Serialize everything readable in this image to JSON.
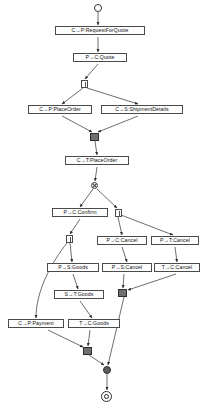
{
  "diagram": {
    "type": "uml-activity-diagram",
    "canvas": {
      "width": 206,
      "height": 412
    },
    "colors": {
      "node_fill": "#fdfdfd",
      "node_stroke": "#4a4a4a",
      "edge_stroke": "#3d3d3d",
      "join_fill": "#6f6f6f",
      "merge_fill": "#5d5d5d",
      "background": "#ffffff"
    },
    "nodes": [
      {
        "id": "start",
        "kind": "initial-state",
        "label": "",
        "x": 94,
        "y": 4,
        "w": 8,
        "h": 8
      },
      {
        "id": "rfq",
        "kind": "activity",
        "label": "C→P:RequestForQuote",
        "x": 55,
        "y": 26,
        "w": 90,
        "h": 11
      },
      {
        "id": "quote",
        "kind": "activity",
        "label": "P→C:Quote",
        "x": 73,
        "y": 53,
        "w": 54,
        "h": 11
      },
      {
        "id": "fork1",
        "kind": "fork",
        "label": "",
        "x": 81,
        "y": 80,
        "w": 7,
        "h": 8
      },
      {
        "id": "placeorder",
        "kind": "activity",
        "label": "C→P:PlaceOrder",
        "x": 28,
        "y": 105,
        "w": 64,
        "h": 11
      },
      {
        "id": "shipdetails",
        "kind": "activity",
        "label": "C→S:ShipmentDetails",
        "x": 101,
        "y": 105,
        "w": 82,
        "h": 11
      },
      {
        "id": "join1",
        "kind": "join",
        "label": "",
        "x": 90,
        "y": 133,
        "w": 9,
        "h": 8
      },
      {
        "id": "tplaceorder",
        "kind": "activity",
        "label": "C→T:PlaceOrder",
        "x": 65,
        "y": 156,
        "w": 64,
        "h": 11
      },
      {
        "id": "xor1",
        "kind": "decision",
        "label": "",
        "x": 91,
        "y": 182,
        "w": 7,
        "h": 7
      },
      {
        "id": "confirm",
        "kind": "activity",
        "label": "P→C:Confirm",
        "x": 52,
        "y": 208,
        "w": 56,
        "h": 11
      },
      {
        "id": "fork2",
        "kind": "fork",
        "label": "",
        "x": 115,
        "y": 209,
        "w": 7,
        "h": 8
      },
      {
        "id": "fork3",
        "kind": "fork",
        "label": "",
        "x": 66,
        "y": 235,
        "w": 7,
        "h": 8
      },
      {
        "id": "pccancel",
        "kind": "activity",
        "label": "P→C:Cancel",
        "x": 97,
        "y": 236,
        "w": 50,
        "h": 11
      },
      {
        "id": "ptcancel",
        "kind": "activity",
        "label": "P→T:Cancel",
        "x": 151,
        "y": 236,
        "w": 48,
        "h": 11
      },
      {
        "id": "psgoods",
        "kind": "activity",
        "label": "P→S:Goods",
        "x": 47,
        "y": 263,
        "w": 52,
        "h": 11
      },
      {
        "id": "pscancel",
        "kind": "activity",
        "label": "P→S:Cancel",
        "x": 102,
        "y": 263,
        "w": 50,
        "h": 11
      },
      {
        "id": "tccancel",
        "kind": "activity",
        "label": "T→C:Cancel",
        "x": 154,
        "y": 263,
        "w": 46,
        "h": 11
      },
      {
        "id": "stgoods",
        "kind": "activity",
        "label": "S→T:Goods",
        "x": 54,
        "y": 290,
        "w": 50,
        "h": 11
      },
      {
        "id": "join2",
        "kind": "join",
        "label": "",
        "x": 118,
        "y": 289,
        "w": 9,
        "h": 8
      },
      {
        "id": "cppayment",
        "kind": "activity",
        "label": "C→P:Payment",
        "x": 8,
        "y": 319,
        "w": 56,
        "h": 11
      },
      {
        "id": "tcgoods",
        "kind": "activity",
        "label": "T→C:Goods",
        "x": 68,
        "y": 319,
        "w": 52,
        "h": 11
      },
      {
        "id": "join3",
        "kind": "join",
        "label": "",
        "x": 83,
        "y": 347,
        "w": 9,
        "h": 8
      },
      {
        "id": "merge1",
        "kind": "merge",
        "label": "",
        "x": 103,
        "y": 366,
        "w": 8,
        "h": 8
      },
      {
        "id": "end",
        "kind": "final-state",
        "label": "",
        "x": 101,
        "y": 391,
        "w": 11,
        "h": 11
      }
    ],
    "edges": [
      {
        "from": "start",
        "to": "rfq"
      },
      {
        "from": "rfq",
        "to": "quote"
      },
      {
        "from": "quote",
        "to": "fork1"
      },
      {
        "from": "fork1",
        "to": "placeorder"
      },
      {
        "from": "fork1",
        "to": "shipdetails"
      },
      {
        "from": "placeorder",
        "to": "join1"
      },
      {
        "from": "shipdetails",
        "to": "join1"
      },
      {
        "from": "join1",
        "to": "tplaceorder"
      },
      {
        "from": "tplaceorder",
        "to": "xor1"
      },
      {
        "from": "xor1",
        "to": "confirm"
      },
      {
        "from": "xor1",
        "to": "fork2"
      },
      {
        "from": "confirm",
        "to": "fork3"
      },
      {
        "from": "fork2",
        "to": "pccancel"
      },
      {
        "from": "fork2",
        "to": "ptcancel"
      },
      {
        "from": "fork3",
        "to": "psgoods"
      },
      {
        "from": "fork3",
        "to": "cppayment"
      },
      {
        "from": "pccancel",
        "to": "pscancel"
      },
      {
        "from": "ptcancel",
        "to": "tccancel"
      },
      {
        "from": "psgoods",
        "to": "stgoods"
      },
      {
        "from": "pscancel",
        "to": "join2"
      },
      {
        "from": "tccancel",
        "to": "join2"
      },
      {
        "from": "stgoods",
        "to": "tcgoods"
      },
      {
        "from": "cppayment",
        "to": "join3"
      },
      {
        "from": "tcgoods",
        "to": "join3"
      },
      {
        "from": "join2",
        "to": "merge1"
      },
      {
        "from": "join3",
        "to": "merge1"
      },
      {
        "from": "merge1",
        "to": "end"
      }
    ]
  }
}
